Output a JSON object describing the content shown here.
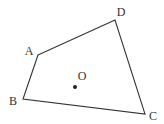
{
  "diagram": {
    "type": "quadrilateral-with-interior-point",
    "colors": {
      "stroke": "#333333",
      "background": "#ffffff"
    },
    "vertices": [
      {
        "id": "A",
        "label": "A",
        "x": 38,
        "y": 55,
        "lx": 29,
        "ly": 55
      },
      {
        "id": "D",
        "label": "D",
        "x": 115,
        "y": 20,
        "lx": 121,
        "ly": 16
      },
      {
        "id": "C",
        "label": "C",
        "x": 145,
        "y": 114,
        "lx": 153,
        "ly": 120
      },
      {
        "id": "B",
        "label": "B",
        "x": 23,
        "y": 99,
        "lx": 13,
        "ly": 105
      }
    ],
    "edges": [
      [
        "A",
        "D"
      ],
      [
        "D",
        "C"
      ],
      [
        "C",
        "B"
      ],
      [
        "B",
        "A"
      ]
    ],
    "interior_point": {
      "id": "O",
      "label": "O",
      "x": 75,
      "y": 87,
      "lx": 82,
      "ly": 80
    }
  }
}
